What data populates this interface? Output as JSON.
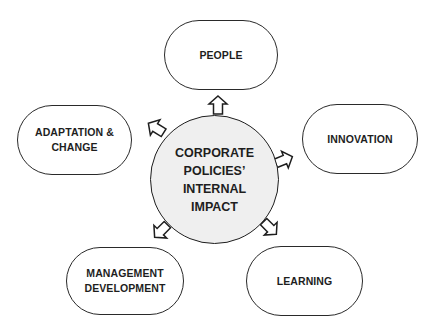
{
  "diagram": {
    "type": "hub-and-spoke",
    "center": {
      "label": "CORPORATE\nPOLICIES’\nINTERNAL\nIMPACT",
      "fill": "#efefef",
      "stroke": "#1e1e1e"
    },
    "nodes": [
      {
        "id": "people",
        "label": "PEOPLE",
        "position": "top"
      },
      {
        "id": "adaptation",
        "label": "ADAPTATION &\nCHANGE",
        "position": "upper-left"
      },
      {
        "id": "innovation",
        "label": "INNOVATION",
        "position": "upper-right"
      },
      {
        "id": "management",
        "label": "MANAGEMENT\nDEVELOPMENT",
        "position": "lower-left"
      },
      {
        "id": "learning",
        "label": "LEARNING",
        "position": "lower-right"
      }
    ],
    "edges": [
      {
        "from": "center",
        "to": "people",
        "style": "hollow-block-arrow"
      },
      {
        "from": "center",
        "to": "adaptation",
        "style": "hollow-block-arrow"
      },
      {
        "from": "center",
        "to": "innovation",
        "style": "hollow-block-arrow"
      },
      {
        "from": "center",
        "to": "management",
        "style": "hollow-block-arrow"
      },
      {
        "from": "center",
        "to": "learning",
        "style": "hollow-block-arrow"
      }
    ],
    "colors": {
      "node_fill": "#ffffff",
      "node_stroke": "#2a2a2a",
      "text": "#1e1e1e",
      "background": "#ffffff"
    }
  }
}
